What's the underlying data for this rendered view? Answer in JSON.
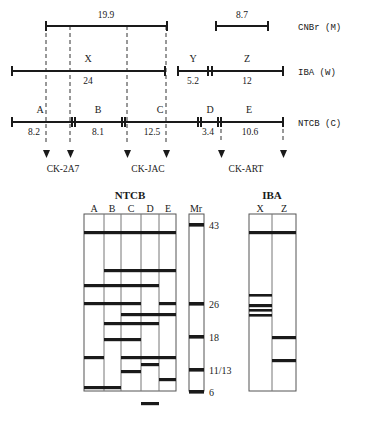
{
  "figure": {
    "top_map": {
      "rows": [
        {
          "id": "cnbr",
          "label": "CNBr (M)",
          "segments": [
            {
              "name": "",
              "value": "19.9",
              "x1": 46,
              "x2": 167
            },
            {
              "name": "",
              "value": "8.7",
              "x1": 216,
              "x2": 268
            }
          ]
        },
        {
          "id": "iba",
          "label": "IBA (W)",
          "segments": [
            {
              "name": "X",
              "value": "24",
              "x1": 12,
              "x2": 165
            },
            {
              "name": "Y",
              "value": "5.2",
              "x1": 178,
              "x2": 209
            },
            {
              "name": "Z",
              "value": "12",
              "x1": 211,
              "x2": 283
            }
          ]
        },
        {
          "id": "ntcb",
          "label": "NTCB (C)",
          "segments": [
            {
              "name": "A",
              "value": "8.2",
              "x1": 12,
              "x2": 72
            },
            {
              "name": "B",
              "value": "8.1",
              "x1": 74,
              "x2": 122
            },
            {
              "name": "C",
              "value": "12.5",
              "x1": 124,
              "x2": 198
            },
            {
              "name": "D",
              "value": "3.4",
              "x1": 200,
              "x2": 219
            },
            {
              "name": "E",
              "value": "10.6",
              "x1": 221,
              "x2": 283
            }
          ]
        }
      ],
      "antibodies": [
        {
          "label": "CK-2A7",
          "x": 63,
          "arrows": [
            47,
            70
          ]
        },
        {
          "label": "CK-JAC",
          "x": 148,
          "arrows": [
            127,
            166
          ]
        },
        {
          "label": "CK-ART",
          "x": 246,
          "arrows": [
            222,
            283
          ]
        }
      ]
    },
    "gels": {
      "panels": [
        {
          "id": "ntcb-gel",
          "title": "NTCB",
          "x": 84,
          "y": 214,
          "width": 92,
          "height": 177,
          "lanes": [
            {
              "label": "A",
              "x": 84,
              "width": 20,
              "bands": [
                19,
                72,
                90,
                144,
                174
              ]
            },
            {
              "label": "B",
              "x": 104,
              "width": 17,
              "bands": [
                19,
                57,
                72,
                90,
                110,
                126,
                174
              ]
            },
            {
              "label": "C",
              "x": 121,
              "width": 20,
              "bands": [
                19,
                57,
                72,
                90,
                101,
                110,
                126,
                144,
                158
              ]
            },
            {
              "label": "D",
              "x": 141,
              "width": 18,
              "bands": [
                19,
                57,
                72,
                101,
                110,
                144,
                151,
                190
              ]
            },
            {
              "label": "E",
              "x": 159,
              "width": 17,
              "bands": [
                19,
                57,
                90,
                101,
                144,
                166
              ]
            }
          ]
        },
        {
          "id": "mr-ladder",
          "title": "Mr",
          "x": 189,
          "y": 214,
          "width": 15,
          "height": 177,
          "markers": [
            {
              "label": "43",
              "y": 11
            },
            {
              "label": "26",
              "y": 90
            },
            {
              "label": "18",
              "y": 123
            },
            {
              "label": "11/13",
              "y": 156
            },
            {
              "label": "6",
              "y": 178
            }
          ]
        },
        {
          "id": "iba-gel",
          "title": "IBA",
          "x": 249,
          "y": 214,
          "width": 47,
          "height": 177,
          "lanes": [
            {
              "label": "X",
              "x": 249,
              "width": 23,
              "bands": [
                19,
                82,
                92,
                97,
                102
              ]
            },
            {
              "label": "Z",
              "x": 272,
              "width": 24,
              "bands": [
                19,
                124,
                147
              ]
            }
          ]
        }
      ]
    }
  }
}
